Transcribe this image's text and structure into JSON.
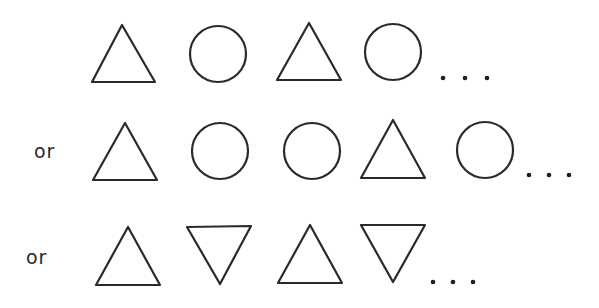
{
  "diagram": {
    "title": "",
    "stroke_color": "#2a2a2a",
    "background": "#ffffff",
    "rows": [
      {
        "prefix": "",
        "sequence": [
          "triangle-up",
          "circle",
          "triangle-up",
          "circle"
        ],
        "continuation": "..."
      },
      {
        "prefix": "or",
        "sequence": [
          "triangle-up",
          "circle",
          "circle",
          "triangle-up",
          "circle"
        ],
        "continuation": "..."
      },
      {
        "prefix": "or",
        "sequence": [
          "triangle-up",
          "triangle-down",
          "triangle-up",
          "triangle-down"
        ],
        "continuation": "..."
      }
    ]
  },
  "labels": {
    "row2_or": "or",
    "row3_or": "or"
  }
}
